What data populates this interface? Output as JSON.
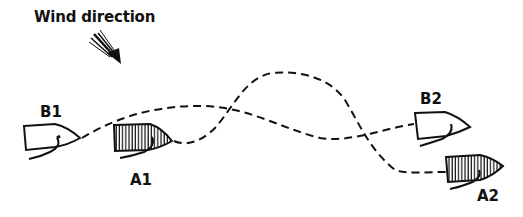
{
  "diagram": {
    "wind": {
      "label": "Wind direction",
      "icon": "arrow-down-right-icon"
    },
    "boats": [
      {
        "id": "B1",
        "label": "B1",
        "fill": "none",
        "position": "start"
      },
      {
        "id": "A1",
        "label": "A1",
        "fill": "hatched",
        "position": "start"
      },
      {
        "id": "B2",
        "label": "B2",
        "fill": "none",
        "position": "end"
      },
      {
        "id": "A2",
        "label": "A2",
        "fill": "hatched",
        "position": "end"
      }
    ],
    "paths": [
      {
        "from": "B1",
        "to": "B2",
        "style": "dashed"
      },
      {
        "from": "A1",
        "to": "A2",
        "style": "dashed"
      }
    ],
    "colors": {
      "ink": "#111111",
      "background": "#ffffff"
    }
  }
}
